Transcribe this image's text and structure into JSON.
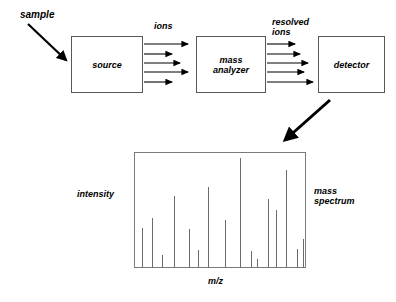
{
  "figure": {
    "title_text": "",
    "sample_label": "sample",
    "ions_label": "ions",
    "resolved_ions_label": "resolved\nions",
    "intensity_label": "intensity",
    "mass_spectrum_label": "mass\nspectrum",
    "mz_label": "m/z",
    "stroke_color": "#000000",
    "box_border_color": "#585858",
    "peak_color": "#6b6b6b",
    "background": "#ffffff"
  },
  "boxes": [
    {
      "name": "source",
      "label": "source"
    },
    {
      "name": "mass-analyzer",
      "label": "mass\nanalyzer"
    },
    {
      "name": "detector",
      "label": "detector"
    }
  ],
  "chart_data": {
    "type": "bar",
    "title": "mass spectrum",
    "xlabel": "m/z",
    "ylabel": "intensity",
    "grid": false,
    "legend": null,
    "xlim": [
      0,
      100
    ],
    "ylim": [
      0,
      100
    ],
    "x": [
      4,
      10,
      16,
      23,
      32,
      37,
      43,
      53,
      62,
      68,
      72,
      78,
      83,
      89,
      95,
      99
    ],
    "values": [
      34,
      43,
      11,
      62,
      33,
      15,
      70,
      41,
      96,
      14,
      7,
      60,
      50,
      85,
      16,
      25
    ],
    "categories": [
      "p1",
      "p2",
      "p3",
      "p4",
      "p5",
      "p6",
      "p7",
      "p8",
      "p9",
      "p10",
      "p11",
      "p12",
      "p13",
      "p14",
      "p15",
      "p16"
    ]
  }
}
